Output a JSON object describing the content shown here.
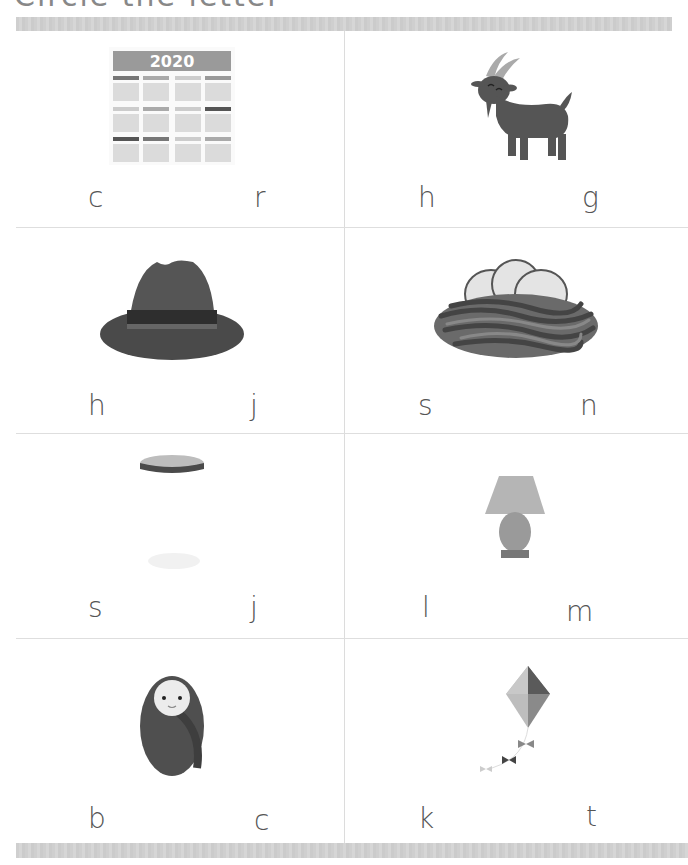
{
  "worksheet": {
    "title": "Circle the letter"
  },
  "cells": [
    {
      "picture": "calendar",
      "picture_text": "2020",
      "choices": [
        "c",
        "r"
      ]
    },
    {
      "picture": "goat",
      "choices": [
        "h",
        "g"
      ]
    },
    {
      "picture": "hat",
      "choices": [
        "h",
        "j"
      ]
    },
    {
      "picture": "nest",
      "choices": [
        "s",
        "n"
      ]
    },
    {
      "picture": "jar",
      "choices": [
        "s",
        "j"
      ]
    },
    {
      "picture": "lamp",
      "choices": [
        "l",
        "m"
      ]
    },
    {
      "picture": "baby",
      "choices": [
        "b",
        "c"
      ]
    },
    {
      "picture": "kite",
      "choices": [
        "k",
        "t"
      ]
    }
  ],
  "colors": {
    "bar": "#d0d0d0",
    "divider": "#dcdcdc",
    "letter": "#555555",
    "dark_fill": "#555555"
  }
}
